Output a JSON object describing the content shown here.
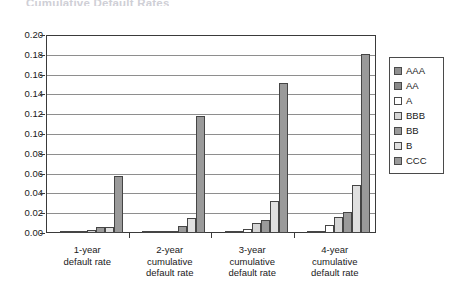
{
  "chart_data": {
    "type": "bar",
    "title": "Cumulative Default Rates",
    "xlabel": "",
    "ylabel": "",
    "ylim": [
      0.0,
      0.2
    ],
    "ytick_step": 0.02,
    "grid": true,
    "legend_position": "right",
    "categories": [
      "1-year\ndefault rate",
      "2-year\ncumulative\ndefault rate",
      "3-year\ncumulative\ndefault rate",
      "4-year\ncumulative\ndefault rate"
    ],
    "category_lines": [
      [
        "1-year",
        "default rate"
      ],
      [
        "2-year",
        "cumulative",
        "default rate"
      ],
      [
        "3-year",
        "cumulative",
        "default rate"
      ],
      [
        "4-year",
        "cumulative",
        "default rate"
      ]
    ],
    "ytick_labels": [
      "0.20",
      "0.18",
      "0.16",
      "0.14",
      "0.12",
      "0.10",
      "0.08",
      "0.06",
      "0.04",
      "0.02",
      "0.00"
    ],
    "ytick_values": [
      0.2,
      0.18,
      0.16,
      0.14,
      0.12,
      0.1,
      0.08,
      0.06,
      0.04,
      0.02,
      0.0
    ],
    "series": [
      {
        "name": "AAA",
        "color": "#8f8f8f",
        "values": [
          0.0,
          0.0,
          0.0,
          0.0
        ]
      },
      {
        "name": "AA",
        "color": "#8a8a8a",
        "values": [
          0.002,
          0.002,
          0.002,
          0.002
        ]
      },
      {
        "name": "A",
        "color": "#ffffff",
        "values": [
          0.002,
          0.002,
          0.004,
          0.008
        ]
      },
      {
        "name": "BBB",
        "color": "#d6d6d6",
        "values": [
          0.003,
          0.002,
          0.01,
          0.016
        ]
      },
      {
        "name": "BB",
        "color": "#9a9a9a",
        "values": [
          0.006,
          0.007,
          0.013,
          0.021
        ]
      },
      {
        "name": "B",
        "color": "#e0e0e0",
        "values": [
          0.006,
          0.015,
          0.032,
          0.048
        ]
      },
      {
        "name": "CCC",
        "color": "#9a9a9a",
        "values": [
          0.058,
          0.118,
          0.152,
          0.181
        ]
      }
    ]
  },
  "legend": {
    "items": [
      {
        "label": "AAA",
        "color": "#8f8f8f"
      },
      {
        "label": "AA",
        "color": "#8a8a8a"
      },
      {
        "label": "A",
        "color": "#ffffff"
      },
      {
        "label": "BBB",
        "color": "#d6d6d6"
      },
      {
        "label": "BB",
        "color": "#9a9a9a"
      },
      {
        "label": "B",
        "color": "#e0e0e0"
      },
      {
        "label": "CCC",
        "color": "#9a9a9a"
      }
    ]
  }
}
